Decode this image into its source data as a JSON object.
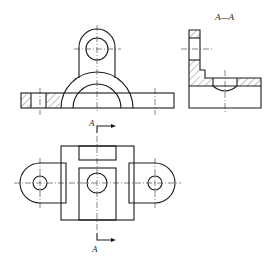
{
  "drawing": {
    "type": "engineering-orthographic-drawing",
    "section_label": "A—A",
    "cut_marker_top": "A",
    "cut_marker_bottom": "A",
    "views": [
      "front-view-half-section",
      "side-section-A-A",
      "top-view"
    ]
  },
  "colors": {
    "line": "#1a1a1a",
    "background": "#ffffff"
  }
}
